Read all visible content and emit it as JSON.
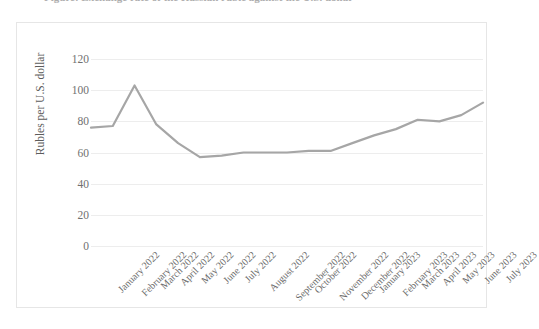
{
  "title": {
    "text": "Figure: Exchange rate of the Russian ruble against the U.S. dollar",
    "visible_note": "clipped-at-top-edge"
  },
  "chart_data": {
    "type": "line",
    "title": "",
    "xlabel": "",
    "ylabel": "Rubles per U.S. dollar",
    "ylim": [
      0,
      120
    ],
    "ytick_labels": [
      "120",
      "100",
      "80",
      "60",
      "40",
      "20",
      "0"
    ],
    "yticks": [
      120,
      100,
      80,
      60,
      40,
      20,
      0
    ],
    "grid": true,
    "legend": "none",
    "line_color": "#a6a6a6",
    "categories": [
      "January 2022",
      "February 2022",
      "March 2022",
      "April 2022",
      "May 2022",
      "June 2022",
      "July 2022",
      "August 2022",
      "September 2022",
      "October 2022",
      "November 2022",
      "December 2022",
      "January 2023",
      "February 2023",
      "March 2023",
      "April 2023",
      "May 2023",
      "June 2023",
      "July 2023"
    ],
    "values": [
      76,
      77,
      103,
      78,
      66,
      57,
      58,
      60,
      60,
      60,
      61,
      61,
      66,
      71,
      75,
      81,
      80,
      84,
      92
    ]
  },
  "colors": {
    "line": "#a6a6a6",
    "gridline": "#ededed",
    "frame": "#e6e6e6",
    "text": "#6b6b6b"
  }
}
